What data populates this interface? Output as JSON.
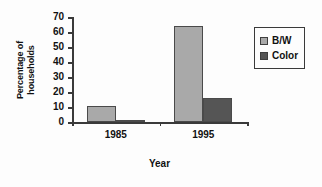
{
  "chart_data": {
    "type": "bar",
    "title": "",
    "subtitle": "",
    "xlabel": "Year",
    "ylabel": "Percentage of households",
    "ylabel_lines": [
      "Percentage of",
      "households"
    ],
    "categories": [
      "1985",
      "1995"
    ],
    "series": [
      {
        "name": "B/W",
        "values": [
          11,
          64
        ],
        "color": "#a9a9a9"
      },
      {
        "name": "Color",
        "values": [
          1,
          16
        ],
        "color": "#555555"
      }
    ],
    "ylim": [
      0,
      70
    ],
    "yticks": [
      0,
      10,
      20,
      30,
      40,
      50,
      60,
      70
    ],
    "ytick_labels": [
      "0",
      "10",
      "20",
      "30",
      "40",
      "50",
      "60",
      "70"
    ],
    "grid": false,
    "legend_position": "right",
    "legend_entries": [
      {
        "label": "B/W",
        "swatch": "#a9a9a9"
      },
      {
        "label": "Color",
        "swatch": "#555555"
      }
    ],
    "background": "#fdfdfd",
    "axis_color": "#3a3a3a"
  }
}
